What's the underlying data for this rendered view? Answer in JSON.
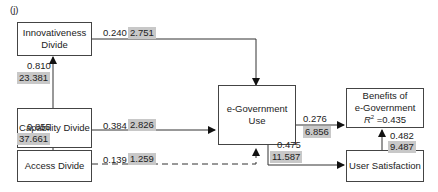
{
  "panel_label": "(j)",
  "nodes": {
    "innovativeness": {
      "line1": "Innovativeness",
      "line2": "Divide"
    },
    "capability": {
      "label": "Capability Divide"
    },
    "access": {
      "label": "Access Divide"
    },
    "egov_use": {
      "label": "e-Government Use"
    },
    "benefits": {
      "line1": "Benefits of",
      "line2": "e-Government",
      "r2_label": "R",
      "r2_sup": "2",
      "r2_value": " =0.435"
    },
    "satisfaction": {
      "label": "User Satisfaction"
    }
  },
  "paths": {
    "innov_to_use": {
      "coef": "0.240",
      "t": "2.751"
    },
    "cap_to_innov": {
      "coef": "0.810",
      "t": "23.381"
    },
    "cap_to_use": {
      "coef": "0.384",
      "t": "2.826"
    },
    "access_to_cap": {
      "coef": "0.855",
      "t": "37.661"
    },
    "access_to_use": {
      "coef": "0.139",
      "t": "1.259",
      "style": "dashed"
    },
    "use_to_benefits": {
      "coef": "0.276",
      "t": "6.856"
    },
    "use_to_satisfaction": {
      "coef": "0.475",
      "t": "11.587"
    },
    "satisfaction_to_benefits": {
      "coef": "0.482",
      "t": "9.487"
    }
  },
  "colors": {
    "tval_bg": "#c8c8c8",
    "line": "#333333"
  }
}
